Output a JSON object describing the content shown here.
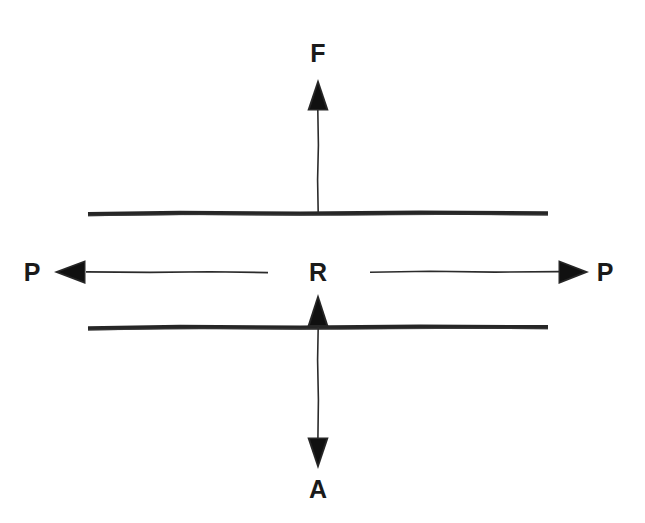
{
  "diagram": {
    "background_color": "#ffffff",
    "ink_color": "#262626",
    "canvas": {
      "width": 645,
      "height": 523
    },
    "labels": {
      "top": "F",
      "left": "P",
      "center": "R",
      "right": "P",
      "bottom": "A"
    },
    "label_positions": {
      "top": {
        "x": 318,
        "y": 62
      },
      "left": {
        "x": 32,
        "y": 281
      },
      "center": {
        "x": 318,
        "y": 281
      },
      "right": {
        "x": 605,
        "y": 281
      },
      "bottom": {
        "x": 318,
        "y": 498
      }
    },
    "horizontal_lines": [
      {
        "name": "upper-plate-line",
        "x1": 88,
        "x2": 548,
        "y": 213,
        "thickness": 4.2
      },
      {
        "name": "lower-plate-line",
        "x1": 88,
        "x2": 548,
        "y": 327,
        "thickness": 4.2
      }
    ],
    "arrows": [
      {
        "name": "force-arrow-up",
        "label": "F",
        "direction": "up",
        "shaft": {
          "x": 318,
          "y_start": 213,
          "y_end": 108
        },
        "head": {
          "tip_x": 318,
          "tip_y": 79,
          "base_y": 110,
          "half_width": 11
        }
      },
      {
        "name": "pressure-arrow-left",
        "label": "P",
        "direction": "left",
        "shaft": {
          "y": 272,
          "x_start": 268,
          "x_end": 86
        },
        "head": {
          "tip_x": 54,
          "tip_y": 272,
          "base_x": 85,
          "half_height": 12
        }
      },
      {
        "name": "pressure-arrow-right",
        "label": "P",
        "direction": "right",
        "shaft": {
          "y": 272,
          "x_start": 370,
          "x_end": 559
        },
        "head": {
          "tip_x": 589,
          "tip_y": 272,
          "base_x": 559,
          "half_height": 12
        }
      },
      {
        "name": "reaction-arrow-up",
        "label": "R",
        "direction": "up",
        "shaft": {
          "x": 318,
          "y_start": 437,
          "y_end": 325
        },
        "head": {
          "tip_x": 318,
          "tip_y": 294,
          "base_y": 326,
          "half_width": 11
        }
      },
      {
        "name": "area-arrow-down",
        "label": "A",
        "direction": "down",
        "shaft": {
          "x": 318,
          "y_start": 327,
          "y_end": 439
        },
        "head": {
          "tip_x": 318,
          "tip_y": 469,
          "base_y": 438,
          "half_width": 11
        }
      }
    ]
  }
}
